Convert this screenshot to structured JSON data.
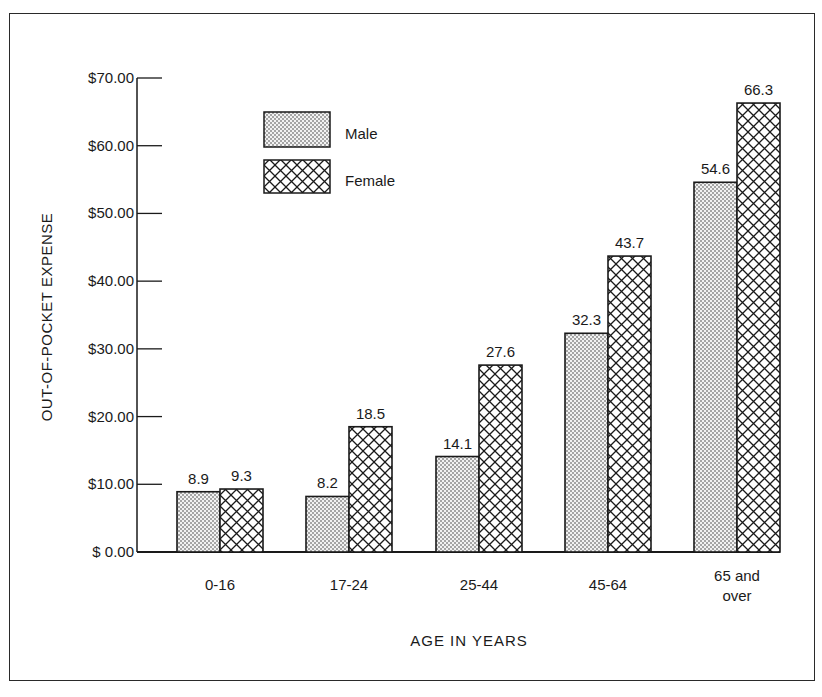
{
  "chart_data": {
    "type": "bar",
    "title": "",
    "xlabel": "AGE IN YEARS",
    "ylabel": "OUT-OF-POCKET EXPENSE",
    "categories": [
      "0-16",
      "17-24",
      "25-44",
      "45-64",
      "65 and over"
    ],
    "category_label_lines": [
      [
        "0-16"
      ],
      [
        "17-24"
      ],
      [
        "25-44"
      ],
      [
        "45-64"
      ],
      [
        "65 and",
        "over"
      ]
    ],
    "series": [
      {
        "name": "Male",
        "pattern": "dots",
        "values": [
          8.9,
          8.2,
          14.1,
          32.3,
          54.6
        ]
      },
      {
        "name": "Female",
        "pattern": "crosshatch",
        "values": [
          9.3,
          18.5,
          27.6,
          43.7,
          66.3
        ]
      }
    ],
    "data_labels": {
      "Male": [
        "8.9",
        "8.2",
        "14.1",
        "32.3",
        "54.6"
      ],
      "Female": [
        "9.3",
        "18.5",
        "27.6",
        "43.7",
        "66.3"
      ]
    },
    "yticks": [
      0,
      10,
      20,
      30,
      40,
      50,
      60,
      70
    ],
    "ytick_labels": [
      "$ 0.00",
      "$10.00",
      "$20.00",
      "$30.00",
      "$40.00",
      "$50.00",
      "$60.00",
      "$70.00"
    ],
    "ylim": [
      0,
      70
    ],
    "grid": false,
    "legend_position": "upper-left inside plot"
  },
  "legend": {
    "male_label": "Male",
    "female_label": "Female"
  },
  "axes": {
    "x_title": "AGE IN YEARS",
    "y_title": "OUT-OF-POCKET EXPENSE"
  }
}
